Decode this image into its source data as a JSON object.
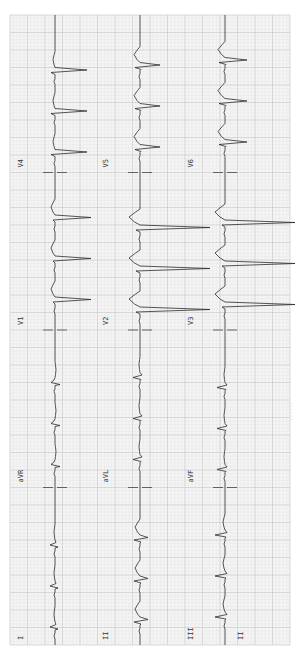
{
  "chart_data": {
    "type": "line",
    "orientation": "rotated-90-clockwise",
    "paper": {
      "grid": true,
      "minor_color": "#e2e2e2",
      "major_color": "#c4c4c4",
      "background": "#f4f4f4",
      "trace_color": "#2b2b2b"
    },
    "layout_rows": [
      [
        "I",
        "aVR",
        "V1",
        "V4"
      ],
      [
        "II",
        "aVL",
        "V2",
        "V5"
      ],
      [
        "III",
        "aVF",
        "V3",
        "V6"
      ],
      [
        "II"
      ]
    ],
    "heart_rate_bpm": 145,
    "rhythm": "regular narrow-complex tachycardia",
    "leads": [
      {
        "name": "I",
        "row": 0,
        "col": 0,
        "qrs": 0.25,
        "q": -0.15,
        "s": -0.05,
        "t": 0.05
      },
      {
        "name": "aVR",
        "row": 0,
        "col": 1,
        "qrs": 0.2,
        "q": -0.25,
        "s": 0.05,
        "t": -0.05
      },
      {
        "name": "V1",
        "row": 0,
        "col": 2,
        "qrs": 0.1,
        "q": 0.0,
        "s": -1.8,
        "t": 0.2
      },
      {
        "name": "V4",
        "row": 0,
        "col": 3,
        "qrs": 0.2,
        "q": 0.0,
        "s": -1.6,
        "t": 0.1
      },
      {
        "name": "II",
        "row": 1,
        "col": 0,
        "qrs": 0.3,
        "q": -0.05,
        "s": -0.4,
        "t": 0.25
      },
      {
        "name": "aVL",
        "row": 1,
        "col": 1,
        "qrs": 0.35,
        "q": -0.05,
        "s": -0.1,
        "t": 0.05
      },
      {
        "name": "V2",
        "row": 1,
        "col": 2,
        "qrs": 0.2,
        "q": 0.0,
        "s": -3.5,
        "t": 0.55
      },
      {
        "name": "V5",
        "row": 1,
        "col": 3,
        "qrs": 0.25,
        "q": -0.05,
        "s": -1.0,
        "t": 0.3
      },
      {
        "name": "III",
        "row": 2,
        "col": 0,
        "qrs": 0.5,
        "q": -0.05,
        "s": -0.1,
        "t": 0.1
      },
      {
        "name": "aVF",
        "row": 2,
        "col": 1,
        "qrs": 0.4,
        "q": -0.05,
        "s": -0.1,
        "t": 0.05
      },
      {
        "name": "V3",
        "row": 2,
        "col": 2,
        "qrs": 0.15,
        "q": 0.0,
        "s": -3.5,
        "t": 0.5
      },
      {
        "name": "V6",
        "row": 2,
        "col": 3,
        "qrs": 0.3,
        "q": -0.05,
        "s": -1.1,
        "t": 0.35
      },
      {
        "name": "II",
        "row": 3,
        "col": 0,
        "rhythm_strip": true,
        "blank": true
      }
    ],
    "calibration_markers": true,
    "caption": "· · · · · ·"
  }
}
